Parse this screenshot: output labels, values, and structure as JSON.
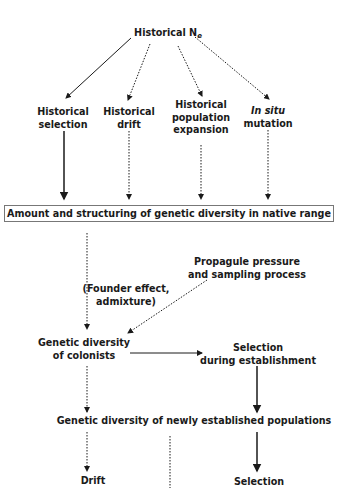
{
  "nodes": {
    "historical_ne": {
      "label": "Historical N",
      "subscript": "e"
    },
    "historical_selection": {
      "line1": "Historical",
      "line2": "selection"
    },
    "historical_drift": {
      "line1": "Historical",
      "line2": "drift"
    },
    "historical_expansion": {
      "line1": "Historical",
      "line2": "population",
      "line3": "expansion"
    },
    "in_situ_mutation": {
      "line1": "In situ",
      "line2": "mutation"
    },
    "native_range_box": {
      "label": "Amount and structuring of genetic diversity in native range"
    },
    "propagule_pressure": {
      "line1": "Propagule pressure",
      "line2": "and sampling process"
    },
    "founder_effect": {
      "line1": "(Founder effect,",
      "line2": "admixture)"
    },
    "colonists": {
      "line1": "Genetic diversity",
      "line2": "of colonists"
    },
    "selection_establishment": {
      "line1": "Selection",
      "line2": "during establishment"
    },
    "newly_established": {
      "label": "Genetic diversity of newly established populations"
    },
    "drift": {
      "label": "Drift"
    },
    "selection": {
      "label": "Selection"
    }
  },
  "legend": {
    "solid_arrow": "selection-related influence",
    "dotted_arrow": "stochastic / demographic influence"
  }
}
